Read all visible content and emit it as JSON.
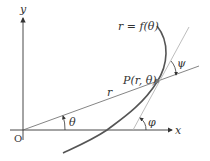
{
  "diagram": {
    "labels": {
      "y_axis": "y",
      "x_axis": "x",
      "origin": "O",
      "curve": "r = f(θ)",
      "point": "P(r, θ)",
      "radius": "r",
      "theta": "θ",
      "psi": "ψ",
      "phi": "φ"
    },
    "colors": {
      "axis": "#333333",
      "curve": "#555555",
      "radius_line": "#666666",
      "tangent_line": "#b0b0b0",
      "point": "#777777",
      "background": "#ffffff"
    }
  }
}
